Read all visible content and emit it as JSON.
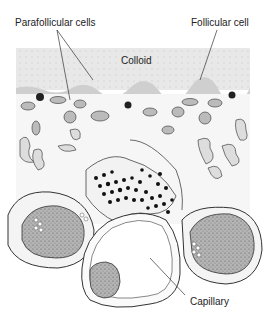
{
  "figure": {
    "labels": {
      "parafollicular": "Parafollicular cells",
      "follicular": "Follicular cell",
      "colloid": "Colloid",
      "capillary": "Capillary"
    },
    "colors": {
      "colloid_fill": "#e6e6e6",
      "stroke": "#333333",
      "nucleus_fill": "#a8a8a8",
      "granule": "#111111",
      "background": "#ffffff"
    }
  }
}
